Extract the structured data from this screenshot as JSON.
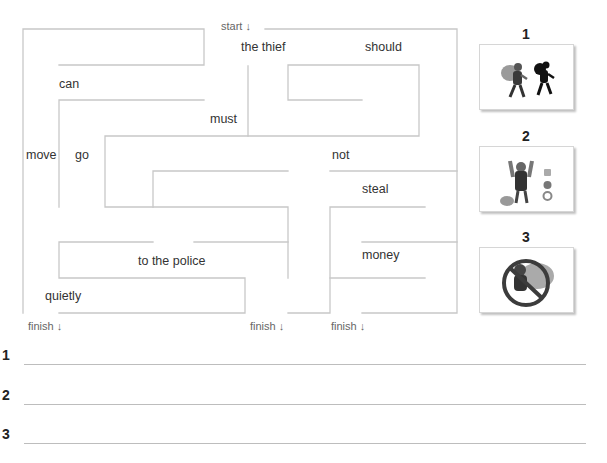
{
  "maze": {
    "start_label": "start ↓",
    "finish_labels": [
      "finish ↓",
      "finish ↓",
      "finish ↓"
    ],
    "words": [
      {
        "text": "the thief",
        "x": 241,
        "y": 40
      },
      {
        "text": "should",
        "x": 365,
        "y": 40
      },
      {
        "text": "can",
        "x": 59,
        "y": 77
      },
      {
        "text": "must",
        "x": 210,
        "y": 112
      },
      {
        "text": "move",
        "x": 26,
        "y": 148
      },
      {
        "text": "go",
        "x": 75,
        "y": 148
      },
      {
        "text": "not",
        "x": 332,
        "y": 148
      },
      {
        "text": "steal",
        "x": 362,
        "y": 182
      },
      {
        "text": "money",
        "x": 362,
        "y": 248
      },
      {
        "text": "to the police",
        "x": 138,
        "y": 254
      },
      {
        "text": "quietly",
        "x": 45,
        "y": 289
      }
    ],
    "line_color": "#c8c8c8"
  },
  "pictures": [
    {
      "number": "1",
      "description": "thief-running-with-sack-and-shadow"
    },
    {
      "number": "2",
      "description": "thief-arms-raised-with-loot"
    },
    {
      "number": "3",
      "description": "thief-crossed-out-prohibition"
    }
  ],
  "answers": {
    "numbers": [
      "1",
      "2",
      "3"
    ],
    "values": [
      "",
      "",
      ""
    ]
  }
}
